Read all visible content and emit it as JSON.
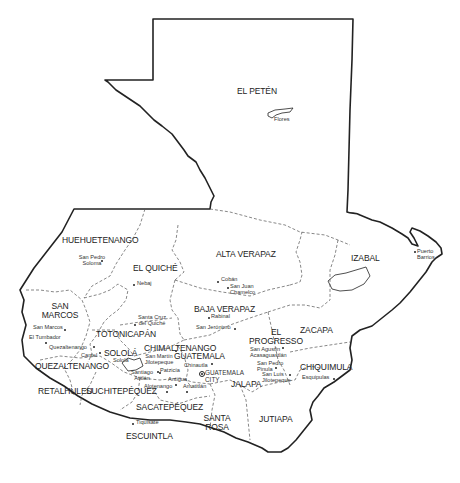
{
  "map": {
    "title": "Guatemala departments",
    "colors": {
      "border": "#222222",
      "department_line": "#555555",
      "background": "#ffffff"
    },
    "departments": [
      {
        "id": "el-peten",
        "label": "EL PETÉN"
      },
      {
        "id": "huehuetenango",
        "label": "HUEHUETENANGO"
      },
      {
        "id": "el-quiche",
        "label": "EL QUICHÉ"
      },
      {
        "id": "alta-verapaz",
        "label": "ALTA VERAPAZ"
      },
      {
        "id": "izabal",
        "label": "IZABAL"
      },
      {
        "id": "san-marcos",
        "label": "SAN MARCOS",
        "lines": [
          "SAN",
          "MARCOS"
        ]
      },
      {
        "id": "baja-verapaz",
        "label": "BAJA VERAPAZ"
      },
      {
        "id": "totonicapan",
        "label": "TOTONICAPÁN"
      },
      {
        "id": "el-progresso",
        "label": "EL PROGRESSO",
        "lines": [
          "EL",
          "PROGRESSO"
        ]
      },
      {
        "id": "zacapa",
        "label": "ZACAPA"
      },
      {
        "id": "chimaltenango",
        "label": "CHIMALTENANGO"
      },
      {
        "id": "solola",
        "label": "SOLOLÁ"
      },
      {
        "id": "guatemala",
        "label": "GUATEMALA"
      },
      {
        "id": "quezaltenango",
        "label": "QUEZALTENANGO"
      },
      {
        "id": "chiquimula",
        "label": "CHIQUIMULA"
      },
      {
        "id": "retalhuleu",
        "label": "RETALHULEU"
      },
      {
        "id": "suchitepequez",
        "label": "SUCHITEPÉQUEZ"
      },
      {
        "id": "jalapa",
        "label": "JALAPA"
      },
      {
        "id": "sacatepequez",
        "label": "SACATEPÉQUEZ"
      },
      {
        "id": "santa-rosa",
        "label": "SANTA ROSA",
        "lines": [
          "SANTA",
          "ROSA"
        ]
      },
      {
        "id": "jutiapa",
        "label": "JUTIAPA"
      },
      {
        "id": "escuintla",
        "label": "ESCUINTLA"
      }
    ],
    "cities": [
      {
        "id": "flores",
        "label": "Flores"
      },
      {
        "id": "puerto-barrios",
        "label": "Puerto Barrios",
        "lines": [
          "Puerto",
          "Barrios"
        ]
      },
      {
        "id": "san-pedro-soloma",
        "label": "San Pedro Soloma",
        "lines": [
          "San Pedro",
          "Soloma"
        ]
      },
      {
        "id": "nebaj",
        "label": "Nebaj"
      },
      {
        "id": "coban",
        "label": "Cobán"
      },
      {
        "id": "san-juan-chamelco",
        "label": "San Juan Chamelco",
        "lines": [
          "San Juan",
          "Chamelco"
        ]
      },
      {
        "id": "rabinal",
        "label": "Rabinal"
      },
      {
        "id": "san-jeronimo",
        "label": "San Jerónimo"
      },
      {
        "id": "santa-cruz-del-quiche",
        "label": "Santa Cruz del Quiché",
        "lines": [
          "Santa Cruz",
          "del Quiché"
        ]
      },
      {
        "id": "san-marcos",
        "label": "San Marcos"
      },
      {
        "id": "el-tumbador",
        "label": "El Tumbador"
      },
      {
        "id": "quezaltenango",
        "label": "Quezaltenango"
      },
      {
        "id": "cantel",
        "label": "Cantel"
      },
      {
        "id": "solola",
        "label": "Sololá"
      },
      {
        "id": "santiago-atitlan",
        "label": "Santiago Atitlán",
        "lines": [
          "Santiago",
          "Atitlán"
        ]
      },
      {
        "id": "san-martin-jilotepeque",
        "label": "San Martín Jilotepeque",
        "lines": [
          "San Martín",
          "Jilotepeque"
        ]
      },
      {
        "id": "patzicia",
        "label": "Patzicía"
      },
      {
        "id": "chinautla",
        "label": "Chinautla"
      },
      {
        "id": "guatemala-city",
        "label": "GUATEMALA CITY",
        "lines": [
          "GUATEMALA",
          "CITY"
        ],
        "capital": true
      },
      {
        "id": "antigua",
        "label": "Antigua"
      },
      {
        "id": "alotenango",
        "label": "Alotenango"
      },
      {
        "id": "amatitlan",
        "label": "Amatitlán"
      },
      {
        "id": "san-agustin-acasaguastlan",
        "label": "San Agustín Acasaguastlán",
        "lines": [
          "San Agustín",
          "Acasaguastlán"
        ]
      },
      {
        "id": "san-pedro-pinula",
        "label": "San Pedro Pinula",
        "lines": [
          "San Pedro",
          "Pinula"
        ]
      },
      {
        "id": "san-luis-jilotepeque",
        "label": "San Luis Jilotepeque",
        "lines": [
          "San Luis",
          "Jilotepeque"
        ]
      },
      {
        "id": "esquipulas",
        "label": "Esquipulas"
      },
      {
        "id": "tiquisate",
        "label": "Tiquisate"
      }
    ]
  }
}
